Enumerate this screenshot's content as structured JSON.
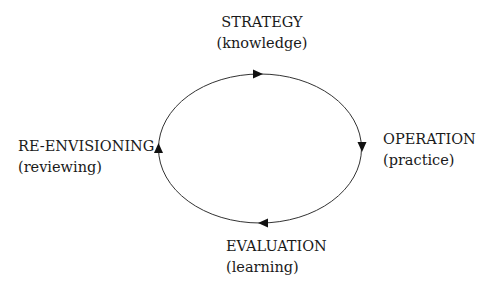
{
  "diagram": {
    "type": "cycle",
    "direction": "clockwise",
    "stroke_color": "#333333",
    "arrow_color": "#111111",
    "nodes": [
      {
        "id": "strategy",
        "title": "STRATEGY",
        "subtitle": "(knowledge)",
        "position": "top"
      },
      {
        "id": "operation",
        "title": "OPERATION",
        "subtitle": "(practice)",
        "position": "right"
      },
      {
        "id": "evaluation",
        "title": "EVALUATION",
        "subtitle": "(learning)",
        "position": "bottom"
      },
      {
        "id": "reenvisioning",
        "title": "RE-ENVISIONING",
        "subtitle": "(reviewing)",
        "position": "left"
      }
    ]
  }
}
